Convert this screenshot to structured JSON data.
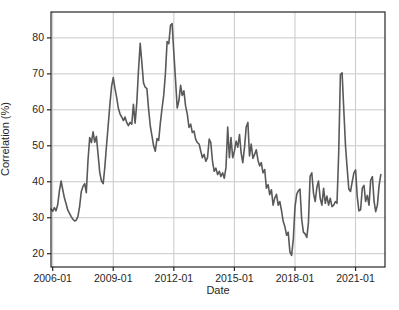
{
  "figure": {
    "background": "#ffffff",
    "width_px": 399,
    "height_px": 310
  },
  "chart_data": {
    "type": "line",
    "title": "",
    "xlabel": "Date",
    "ylabel": "Correlation (%)",
    "x_start": "2005-12",
    "x_interval": "monthly",
    "n_points": 197,
    "values": [
      32.4,
      31.8,
      32.8,
      31.9,
      33.6,
      37.5,
      40.2,
      37.7,
      35.4,
      33.9,
      32.1,
      31.2,
      30.3,
      29.6,
      29.1,
      29.3,
      30.3,
      33.1,
      37.3,
      38.7,
      39.5,
      37.0,
      46.0,
      52.3,
      50.9,
      53.9,
      51.0,
      52.6,
      47.5,
      42.5,
      40.2,
      39.5,
      44.0,
      50.0,
      55.7,
      61.5,
      66.5,
      69.0,
      66.0,
      63.5,
      60.5,
      58.9,
      58.0,
      57.0,
      58.0,
      56.5,
      55.6,
      56.5,
      56.0,
      61.5,
      56.3,
      62.0,
      71.0,
      78.5,
      73.0,
      67.5,
      66.3,
      65.9,
      60.2,
      55.5,
      52.7,
      50.0,
      48.5,
      52.0,
      51.5,
      56.5,
      60.5,
      64.0,
      70.0,
      79.0,
      78.4,
      83.5,
      84.0,
      76.0,
      68.5,
      60.5,
      62.5,
      66.8,
      64.0,
      65.3,
      61.0,
      58.8,
      55.1,
      56.0,
      53.7,
      54.1,
      51.8,
      50.9,
      50.5,
      48.5,
      46.7,
      47.6,
      45.7,
      46.7,
      51.9,
      50.9,
      45.7,
      42.9,
      43.8,
      42.0,
      42.9,
      41.5,
      42.5,
      41.0,
      44.0,
      55.2,
      46.7,
      52.3,
      46.7,
      48.5,
      51.3,
      49.6,
      53.1,
      48.1,
      45.3,
      49.5,
      55.2,
      56.5,
      47.2,
      50.5,
      46.5,
      47.6,
      48.9,
      46.0,
      44.4,
      45.3,
      42.5,
      43.4,
      38.2,
      39.2,
      36.4,
      37.8,
      33.5,
      35.5,
      36.5,
      33.5,
      34.5,
      32.0,
      29.0,
      27.5,
      25.1,
      26.0,
      20.5,
      19.5,
      24.0,
      33.0,
      36.5,
      37.5,
      38.0,
      29.5,
      26.0,
      25.5,
      24.5,
      28.5,
      41.5,
      42.5,
      36.8,
      34.5,
      38.5,
      40.2,
      35.4,
      33.5,
      38.2,
      34.0,
      36.0,
      33.5,
      35.4,
      33.1,
      33.5,
      34.5,
      34.0,
      48.0,
      69.8,
      70.3,
      60.0,
      50.0,
      44.0,
      38.0,
      37.3,
      40.0,
      42.5,
      43.3,
      36.0,
      31.9,
      32.2,
      38.2,
      39.0,
      34.5,
      36.2,
      33.5,
      40.5,
      41.4,
      34.5,
      31.7,
      33.5,
      39.0,
      42.0
    ],
    "xticks": [
      "2006-01",
      "2009-01",
      "2012-01",
      "2015-01",
      "2018-01",
      "2021-01"
    ],
    "yticks": [
      20,
      30,
      40,
      50,
      60,
      70,
      80
    ],
    "ylim": [
      16.3,
      87.2
    ],
    "xlim_months_rel_2006_01": [
      -1,
      197.5
    ],
    "grid": true,
    "legend": "none",
    "line_color": "#595959",
    "grid_color": "#c9c9c9",
    "spine_color": "#262626",
    "tick_text_color": "#262626"
  }
}
